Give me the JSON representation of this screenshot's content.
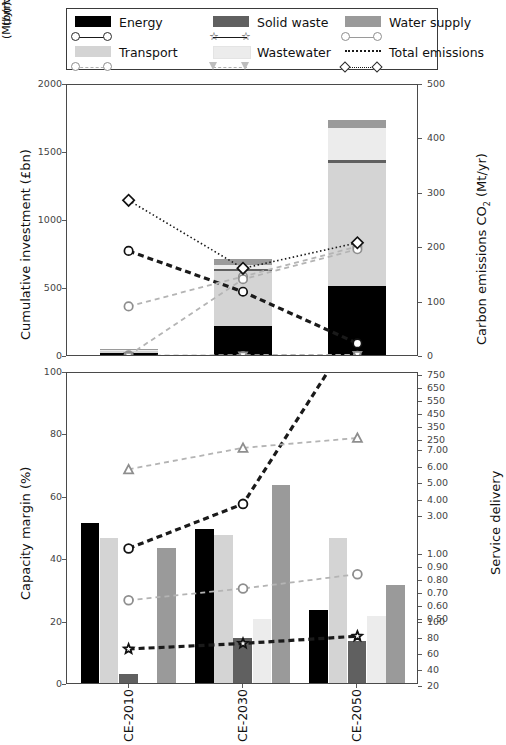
{
  "legend": {
    "entries": [
      {
        "label": "Energy",
        "color": "#000000",
        "marker": "circle",
        "line": "solid-dark"
      },
      {
        "label": "Solid waste",
        "color": "#606060",
        "marker": "star",
        "line": "solid-dark"
      },
      {
        "label": "Water supply",
        "color": "#9a9a9a",
        "marker": "circle-gray",
        "line": "solid-gray"
      },
      {
        "label": "Transport",
        "color": "#d4d4d4",
        "marker": "circle-gray",
        "line": "dashed-gray"
      },
      {
        "label": "Wastewater",
        "color": "#ececec",
        "marker": "triangle-down",
        "line": "dashed-gray"
      },
      {
        "label": "Total emissions",
        "color": "none",
        "marker": "diamond",
        "line": "dotted-dark"
      }
    ]
  },
  "chart_data": [
    {
      "type": "bar",
      "id": "top-panel",
      "title": "",
      "categories": [
        "CE-2010",
        "CE-2030",
        "CE-2050"
      ],
      "xlabel": "",
      "ylabel": "Cumulative investment (£bn)",
      "ylim": [
        0,
        2000
      ],
      "yticks": [
        0,
        500,
        1000,
        1500,
        2000
      ],
      "y2label": "Carbon emissions CO₂ (Mt/yr)",
      "y2lim": [
        0,
        500
      ],
      "y2ticks": [
        0,
        100,
        200,
        300,
        400,
        500
      ],
      "grid": false,
      "stacked": true,
      "series": [
        {
          "name": "Energy",
          "color": "#000000",
          "values": [
            30,
            230,
            520
          ]
        },
        {
          "name": "Transport",
          "color": "#d4d4d4",
          "values": [
            20,
            400,
            910
          ]
        },
        {
          "name": "Solid waste",
          "color": "#606060",
          "values": [
            2,
            18,
            22
          ]
        },
        {
          "name": "Wastewater",
          "color": "#ececec",
          "values": [
            2,
            30,
            230
          ]
        },
        {
          "name": "Water supply",
          "color": "#9a9a9a",
          "values": [
            2,
            42,
            60
          ]
        }
      ],
      "stack_totals": [
        56,
        720,
        1742
      ],
      "lines": [
        {
          "name": "Energy emissions",
          "marker": "circle",
          "style": "dashed-dark",
          "unit": "Mt/yr",
          "values": [
            195,
            120,
            25
          ]
        },
        {
          "name": "Transport emissions",
          "marker": "circle-gray",
          "style": "dashed-gray",
          "unit": "Mt/yr",
          "values": [
            93,
            148,
            203
          ]
        },
        {
          "name": "Water supply emissions",
          "marker": "circle-gray",
          "style": "dashed-gray",
          "unit": "Mt/yr",
          "values": [
            3,
            143,
            198
          ]
        },
        {
          "name": "Solid waste emissions",
          "marker": "star",
          "style": "dashed-gray",
          "unit": "Mt/yr",
          "values": [
            2,
            3,
            4
          ]
        },
        {
          "name": "Wastewater emissions",
          "marker": "triangle-down",
          "style": "dashed-gray",
          "unit": "Mt/yr",
          "values": [
            2,
            3,
            4
          ]
        },
        {
          "name": "Total emissions",
          "marker": "diamond",
          "style": "dotted-dark",
          "unit": "Mt/yr",
          "values": [
            288,
            163,
            210
          ]
        }
      ]
    },
    {
      "type": "bar",
      "id": "bottom-panel",
      "title": "",
      "categories": [
        "CE-2010",
        "CE-2030",
        "CE-2050"
      ],
      "xlabel": "",
      "ylabel": "Capacity margin (%)",
      "ylim": [
        0,
        100
      ],
      "yticks": [
        0,
        20,
        40,
        60,
        80,
        100
      ],
      "y2label": "Service delivery",
      "grid": false,
      "grouped": true,
      "series": [
        {
          "name": "Energy",
          "color": "#000000",
          "values": [
            52,
            50,
            24
          ]
        },
        {
          "name": "Transport",
          "color": "#d4d4d4",
          "values": [
            47,
            48,
            47
          ]
        },
        {
          "name": "Solid waste",
          "color": "#606060",
          "values": [
            3.5,
            15,
            14
          ]
        },
        {
          "name": "Wastewater",
          "color": "#ececec",
          "values": [
            0,
            21,
            22
          ]
        },
        {
          "name": "Water supply",
          "color": "#9a9a9a",
          "values": [
            44,
            64,
            32
          ]
        }
      ],
      "right_axis_segments": [
        {
          "unit": "(mn MWh/yr)",
          "ticks": [
            "250",
            "350",
            "450",
            "550",
            "650",
            "750"
          ]
        },
        {
          "unit": "(mn ML/yr)",
          "ticks": [
            "3.00",
            "4.00",
            "5.00",
            "6.00",
            "7.00"
          ]
        },
        {
          "unit": "(bn Vkm/yr)",
          "ticks": [
            "0.50",
            "0.60",
            "0.70",
            "0.80",
            "0.90",
            "1.00"
          ]
        },
        {
          "unit": "(Mt/yr)",
          "ticks": [
            "20",
            "40",
            "60",
            "80",
            "100"
          ]
        }
      ],
      "lines": [
        {
          "name": "Energy delivery",
          "marker": "circle",
          "style": "dashed-dark",
          "unit": "mn MWh/yr",
          "values": [
            430,
            490,
            730
          ]
        },
        {
          "name": "Transport delivery",
          "marker": "triangle-down",
          "style": "dashed-gray",
          "unit": "bn Vkm/yr",
          "values": [
            3.4,
            4.1,
            4.3
          ]
        },
        {
          "name": "Water supply delivery",
          "marker": "triangle-up",
          "style": "dashed-gray",
          "unit": "mn ML/yr",
          "values": [
            4.8,
            6.1,
            6.7
          ]
        },
        {
          "name": "Wastewater delivery",
          "marker": "circle-gray",
          "style": "dashed-gray",
          "unit": "bn Vkm/yr",
          "values": [
            0.56,
            0.65,
            0.76
          ]
        },
        {
          "name": "Solid waste delivery",
          "marker": "star",
          "style": "dashed-dark",
          "unit": "Mt/yr",
          "values": [
            60,
            67,
            76
          ]
        }
      ]
    }
  ]
}
